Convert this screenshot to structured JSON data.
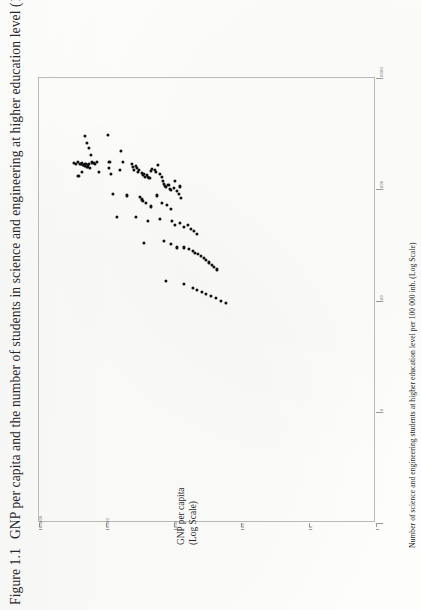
{
  "figure": {
    "caption_number": "Figure 1.1",
    "caption_text": "GNP per capita and the number of students in science and engineering at higher education level (199"
  },
  "axes": {
    "x": {
      "title_line1": "GNP per capita",
      "title_line2": "(Log Scale)",
      "scale": "log",
      "tick_labels": [
        "100000",
        "10000",
        "1000",
        "100",
        "10",
        "1"
      ],
      "tick_values": [
        100000,
        10000,
        1000,
        100,
        10,
        1
      ]
    },
    "y": {
      "title": "Number of science  and engineering students at higher education level per 100 000 inh. (Log Scale)",
      "scale": "log",
      "tick_labels": [
        "10000",
        "1000",
        "100",
        "10",
        "1"
      ],
      "tick_values": [
        10000,
        1000,
        100,
        10,
        1
      ]
    }
  },
  "chart_data": {
    "type": "scatter",
    "title": "Figure 1.1  GNP per capita and the number of students in science and engineering at higher education level (199",
    "xlabel": "GNP per capita (Log Scale)",
    "ylabel": "Number of science and engineering students at higher education level per 100 000 inh. (Log Scale)",
    "xscale": "log",
    "yscale": "log",
    "xlim": [
      1,
      100000
    ],
    "ylim": [
      1,
      10000
    ],
    "grid": false,
    "legend": null,
    "marker": "filled-circle",
    "marker_color": "#111111",
    "n_points": 118,
    "note": "Points digitised from the scanned figure; x = GNP per capita (US$), y = S&E students per 100 000 inhabitants.",
    "points": [
      [
        21000,
        3000
      ],
      [
        19500,
        2600
      ],
      [
        18000,
        2350
      ],
      [
        17000,
        2050
      ],
      [
        26500,
        1750
      ],
      [
        25000,
        1700
      ],
      [
        24000,
        1690
      ],
      [
        23000,
        1720
      ],
      [
        22000,
        1660
      ],
      [
        21500,
        1640
      ],
      [
        21000,
        1700
      ],
      [
        20500,
        1620
      ],
      [
        20000,
        1680
      ],
      [
        19500,
        1600
      ],
      [
        19000,
        1650
      ],
      [
        18500,
        1580
      ],
      [
        18000,
        1700
      ],
      [
        17500,
        1560
      ],
      [
        30000,
        1720
      ],
      [
        28000,
        1680
      ],
      [
        16500,
        1740
      ],
      [
        15500,
        1730
      ],
      [
        15000,
        1700
      ],
      [
        14000,
        1760
      ],
      [
        9500,
        3050
      ],
      [
        9000,
        1760
      ],
      [
        9200,
        1560
      ],
      [
        23000,
        1420
      ],
      [
        26000,
        1320
      ],
      [
        13000,
        1440
      ],
      [
        6000,
        2200
      ],
      [
        5600,
        1760
      ],
      [
        6300,
        1500
      ],
      [
        8500,
        1380
      ],
      [
        4200,
        1700
      ],
      [
        4000,
        1600
      ],
      [
        3900,
        1500
      ],
      [
        3600,
        1620
      ],
      [
        3500,
        1560
      ],
      [
        3400,
        1430
      ],
      [
        3300,
        1480
      ],
      [
        3000,
        1400
      ],
      [
        2900,
        1340
      ],
      [
        2800,
        1380
      ],
      [
        2700,
        1300
      ],
      [
        2500,
        1340
      ],
      [
        2400,
        1290
      ],
      [
        2300,
        1260
      ],
      [
        2200,
        1450
      ],
      [
        2100,
        1520
      ],
      [
        1900,
        1480
      ],
      [
        1850,
        1420
      ],
      [
        1700,
        1660
      ],
      [
        1600,
        1380
      ],
      [
        1500,
        1300
      ],
      [
        1450,
        1180
      ],
      [
        1400,
        1120
      ],
      [
        1350,
        1080
      ],
      [
        1300,
        1040
      ],
      [
        1200,
        1100
      ],
      [
        1150,
        1000
      ],
      [
        1100,
        980
      ],
      [
        1000,
        1020
      ],
      [
        950,
        1180
      ],
      [
        900,
        960
      ],
      [
        850,
        900
      ],
      [
        800,
        1060
      ],
      [
        780,
        840
      ],
      [
        8000,
        900
      ],
      [
        5000,
        880
      ],
      [
        3200,
        860
      ],
      [
        3000,
        820
      ],
      [
        2950,
        800
      ],
      [
        2900,
        780
      ],
      [
        2600,
        760
      ],
      [
        2200,
        700
      ],
      [
        1800,
        880
      ],
      [
        1500,
        760
      ],
      [
        1250,
        720
      ],
      [
        1100,
        660
      ],
      [
        7000,
        560
      ],
      [
        3600,
        560
      ],
      [
        2400,
        520
      ],
      [
        1600,
        540
      ],
      [
        1050,
        520
      ],
      [
        950,
        480
      ],
      [
        820,
        500
      ],
      [
        700,
        460
      ],
      [
        620,
        480
      ],
      [
        560,
        440
      ],
      [
        500,
        420
      ],
      [
        460,
        400
      ],
      [
        2800,
        330
      ],
      [
        1400,
        340
      ],
      [
        1100,
        320
      ],
      [
        900,
        300
      ],
      [
        700,
        300
      ],
      [
        600,
        290
      ],
      [
        520,
        280
      ],
      [
        480,
        270
      ],
      [
        440,
        260
      ],
      [
        400,
        250
      ],
      [
        360,
        240
      ],
      [
        330,
        230
      ],
      [
        300,
        220
      ],
      [
        270,
        210
      ],
      [
        250,
        200
      ],
      [
        230,
        190
      ],
      [
        1300,
        150
      ],
      [
        700,
        140
      ],
      [
        520,
        130
      ],
      [
        460,
        125
      ],
      [
        380,
        120
      ],
      [
        330,
        115
      ],
      [
        280,
        110
      ],
      [
        240,
        105
      ],
      [
        200,
        100
      ],
      [
        170,
        95
      ]
    ]
  }
}
